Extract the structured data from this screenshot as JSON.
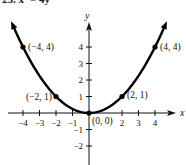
{
  "chart_data": {
    "type": "line",
    "title": "25. x² = 4y",
    "equation": "y = x^2 / 4",
    "xlabel": "x",
    "ylabel": "y",
    "xlim": [
      -4.6,
      4.6
    ],
    "ylim": [
      -2.6,
      5.2
    ],
    "xticks": [
      -4,
      -3,
      -2,
      -1,
      2,
      3,
      4
    ],
    "xtick_labels": [
      "−4",
      "−3",
      "−2",
      "−1",
      "2",
      "3",
      "4"
    ],
    "yticks": [
      4,
      3,
      2,
      1,
      -1,
      -2
    ],
    "ytick_labels": [
      "4",
      "3",
      "2",
      "1",
      "−1",
      "−2"
    ],
    "grid": false,
    "curve_domain": [
      -4.6,
      4.6
    ],
    "points": [
      {
        "x": -4,
        "y": 4,
        "label": "(−4, 4)"
      },
      {
        "x": -2,
        "y": 1,
        "label": "(−2, 1)"
      },
      {
        "x": 0,
        "y": 0,
        "label": "(0, 0)"
      },
      {
        "x": 2,
        "y": 1,
        "label": "(2, 1)"
      },
      {
        "x": 4,
        "y": 4,
        "label": "(4, 4)"
      }
    ]
  }
}
